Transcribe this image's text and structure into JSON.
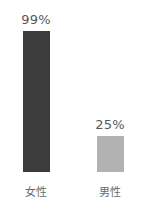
{
  "chart_data": {
    "type": "bar",
    "title": "",
    "xlabel": "",
    "ylabel": "",
    "ylim": [
      0,
      100
    ],
    "grid": false,
    "legend": "none",
    "categories": [
      "女性",
      "男性"
    ],
    "values": [
      99,
      25
    ],
    "value_labels": [
      "99%",
      "25%"
    ],
    "colors": [
      "#3c3c3c",
      "#b2b2b2"
    ],
    "background": "#ffffff",
    "label_color": "#6b6b6b",
    "value_label_color": "#585858"
  }
}
